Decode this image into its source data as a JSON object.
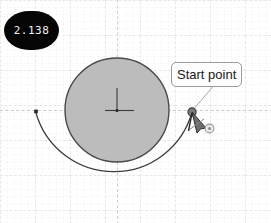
{
  "app": {
    "name": "cad-sketch-canvas",
    "background_color": "#ffffff"
  },
  "grid": {
    "minor_color": "#e2e2e2",
    "major_color": "#d0d0d0",
    "minor_spacing": 7,
    "major_spacing": 35,
    "style": "dashed",
    "visible": true
  },
  "value_badge": {
    "label": "2.138",
    "background_color": "#050505",
    "text_color": "#f2f2f2"
  },
  "tooltip": {
    "label": "Start point",
    "background_color": "#fdfdfd",
    "border_color": "#9a9a9a",
    "text_color": "#1a1a1a"
  },
  "geometry": {
    "circle": {
      "name": "filled-circle",
      "cx": 117,
      "cy": 110,
      "r": 52,
      "fill_color": "#b6b6b6",
      "stroke_color": "#4a4a4a",
      "stroke_width": 1.4
    },
    "center_marker": {
      "name": "circle-center-crosshair",
      "cx": 117,
      "cy": 110,
      "color": "#3a3a3a"
    },
    "arc": {
      "name": "construction-arc",
      "cx": 117,
      "cy": 110,
      "r": 81,
      "start_angle_deg": 178,
      "end_angle_deg": 358,
      "stroke_color": "#3d3d3d",
      "stroke_width": 1.2
    },
    "arc_end_point": {
      "name": "arc-end-point",
      "x": 36,
      "y": 112,
      "color": "#262626"
    },
    "start_point": {
      "name": "start-point-handle",
      "x": 192,
      "y": 112,
      "color": "#737373",
      "stroke_color": "#3a3a3a"
    },
    "snap_marker": {
      "name": "coincident-snap-marker",
      "x": 209,
      "y": 128,
      "color": "#9a9a9a"
    },
    "leader_line": {
      "name": "tooltip-leader-line",
      "x1": 192,
      "y1": 111,
      "x2": 214,
      "y2": 84,
      "color": "#9e9e9e"
    }
  },
  "cursor": {
    "name": "draw-arc-cursor",
    "x": 192,
    "y": 112,
    "color": "#3a3a3a"
  }
}
